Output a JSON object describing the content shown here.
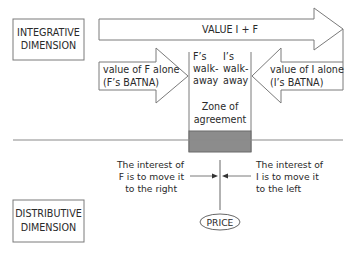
{
  "diagram": {
    "integrative_label": [
      "INTEGRATIVE",
      "DIMENSION"
    ],
    "distributive_label": [
      "DISTRIBUTIVE",
      "DIMENSION"
    ],
    "value_total": "VALUE I + F",
    "f_batna": [
      "value of F alone",
      "(F’s BATNA)"
    ],
    "i_batna": [
      "value of I alone",
      "(I’s BATNA)"
    ],
    "f_walkaway": [
      "F’s",
      "walk-",
      "away"
    ],
    "i_walkaway": [
      "I’s",
      "walk-",
      "away"
    ],
    "zone": [
      "Zone of",
      "agreement"
    ],
    "f_interest": [
      "The interest of",
      "F is to move it",
      "to the right"
    ],
    "i_interest": [
      "The interest of",
      "I is to move it",
      "to the left"
    ],
    "price": "PRICE"
  },
  "colors": {
    "line": "#7a7a7a",
    "text": "#2a2a2a",
    "zone_fill": "#8c8c8c"
  }
}
